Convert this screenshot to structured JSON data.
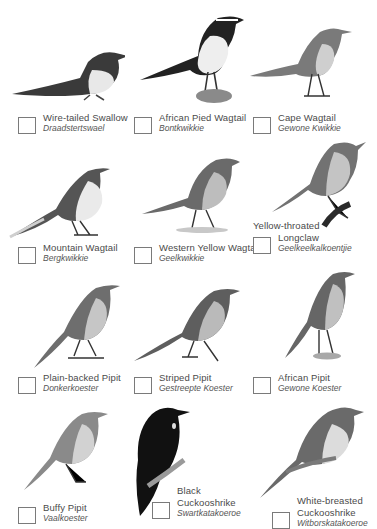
{
  "page": {
    "type": "bird checklist",
    "background": "#ffffff",
    "checkbox_border": "#7a7a7a",
    "text_color": "#4a4a4a"
  },
  "birds": [
    {
      "english": "Wire-tailed Swallow",
      "english_lines": [
        "Wire-tailed Swallow"
      ],
      "afrikaans": "Draadstertswael",
      "icon": "swallow-illustration",
      "checked": false
    },
    {
      "english": "African Pied Wagtail",
      "english_lines": [
        "African Pied Wagtail"
      ],
      "afrikaans": "Bontkwikkie",
      "icon": "pied-wagtail-illustration",
      "checked": false
    },
    {
      "english": "Cape Wagtail",
      "english_lines": [
        "Cape Wagtail"
      ],
      "afrikaans": "Gewone Kwikkie",
      "icon": "cape-wagtail-illustration",
      "checked": false
    },
    {
      "english": "Mountain Wagtail",
      "english_lines": [
        "Mountain Wagtail"
      ],
      "afrikaans": "Bergkwikkie",
      "icon": "mountain-wagtail-illustration",
      "checked": false
    },
    {
      "english": "Western Yellow Wagtail",
      "english_lines": [
        "Western Yellow Wagtail"
      ],
      "afrikaans": "Geelkwikkie",
      "icon": "yellow-wagtail-illustration",
      "checked": false
    },
    {
      "english": "Yellow-throated Longclaw",
      "english_lines": [
        "Yellow-throated",
        "Longclaw"
      ],
      "afrikaans": "Geelkeelkalkoentjie",
      "icon": "longclaw-illustration",
      "checked": false
    },
    {
      "english": "Plain-backed Pipit",
      "english_lines": [
        "Plain-backed Pipit"
      ],
      "afrikaans": "Donkerkoester",
      "icon": "plain-backed-pipit-illustration",
      "checked": false
    },
    {
      "english": "Striped Pipit",
      "english_lines": [
        "Striped Pipit"
      ],
      "afrikaans": "Gestreepte Koester",
      "icon": "striped-pipit-illustration",
      "checked": false
    },
    {
      "english": "African Pipit",
      "english_lines": [
        "African Pipit"
      ],
      "afrikaans": "Gewone Koester",
      "icon": "african-pipit-illustration",
      "checked": false
    },
    {
      "english": "Buffy Pipit",
      "english_lines": [
        "Buffy Pipit"
      ],
      "afrikaans": "Vaalkoester",
      "icon": "buffy-pipit-illustration",
      "checked": false
    },
    {
      "english": "Black Cuckooshrike",
      "english_lines": [
        "Black",
        "Cuckooshrike"
      ],
      "afrikaans": "Swartkatakoeroe",
      "icon": "black-cuckooshrike-illustration",
      "checked": false
    },
    {
      "english": "White-breasted Cuckooshrike",
      "english_lines": [
        "White-breasted",
        "Cuckooshrike"
      ],
      "afrikaans": "Witborskatakoeroe",
      "icon": "white-breasted-cuckooshrike-illustration",
      "checked": false
    }
  ]
}
